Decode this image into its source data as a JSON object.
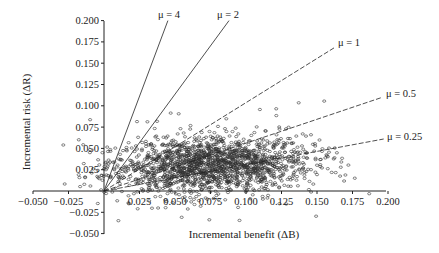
{
  "chart_data": {
    "type": "scatter",
    "title": "",
    "xlabel": "Incremental benefit (ΔB)",
    "ylabel": "Incremental risk (ΔR)",
    "xlim": [
      -0.05,
      0.2
    ],
    "ylim": [
      -0.05,
      0.2
    ],
    "x_ticks": [
      "−0.050",
      "−0.025",
      "0.025",
      "0.050",
      "0.075",
      "0.100",
      "0.125",
      "0.150",
      "0.175",
      "0.200"
    ],
    "x_tick_values": [
      -0.05,
      -0.025,
      0.025,
      0.05,
      0.075,
      0.1,
      0.125,
      0.15,
      0.175,
      0.2
    ],
    "y_ticks": [
      "0.200",
      "0.175",
      "0.150",
      "0.125",
      "0.100",
      "0.075",
      "0.050",
      "0.025",
      "−0.025",
      "−0.050"
    ],
    "y_tick_values": [
      0.2,
      0.175,
      0.15,
      0.125,
      0.1,
      0.075,
      0.05,
      0.025,
      -0.025,
      -0.05
    ],
    "grid": false,
    "legend": "none",
    "reference_lines": [
      {
        "label": "μ = 4",
        "slope": 4,
        "style": "solid",
        "end": [
          0.045,
          0.2
        ]
      },
      {
        "label": "μ = 2",
        "slope": 2,
        "style": "solid",
        "end": [
          0.088,
          0.2
        ]
      },
      {
        "label": "μ = 1",
        "slope": 1,
        "style": "dashed",
        "end": [
          0.162,
          0.168
        ]
      },
      {
        "label": "μ = 0.5",
        "slope": 0.5,
        "style": "dashed",
        "end": [
          0.196,
          0.11
        ]
      },
      {
        "label": "μ = 0.25",
        "slope": 0.25,
        "style": "dashed",
        "end": [
          0.197,
          0.061
        ]
      }
    ],
    "scatter_summary": {
      "marker": "open circle",
      "approx_points": 2500,
      "center_x": 0.075,
      "center_y": 0.03,
      "spread_x": 0.035,
      "spread_y": 0.016,
      "x_range": [
        -0.03,
        0.19
      ],
      "y_range": [
        -0.035,
        0.11
      ]
    }
  },
  "labels": {
    "xlabel": "Incremental benefit (ΔB)",
    "ylabel": "Incremental risk (ΔR)",
    "mu4": "μ = 4",
    "mu2": "μ = 2",
    "mu1": "μ = 1",
    "mu05": "μ = 0.5",
    "mu025": "μ = 0.25"
  }
}
